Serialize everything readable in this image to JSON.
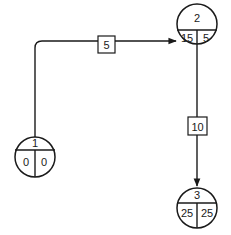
{
  "diagram": {
    "type": "network-activity-on-node",
    "colors": {
      "line": "#1a1a1a",
      "background": "#ffffff"
    },
    "nodes": [
      {
        "id": "1",
        "label": "1",
        "left": "0",
        "right": "0"
      },
      {
        "id": "2",
        "label": "2",
        "left": "15",
        "right": "5"
      },
      {
        "id": "3",
        "label": "3",
        "left": "25",
        "right": "25"
      }
    ],
    "edges": [
      {
        "from": "1",
        "to": "2",
        "duration": "5"
      },
      {
        "from": "2",
        "to": "3",
        "duration": "10"
      }
    ]
  }
}
